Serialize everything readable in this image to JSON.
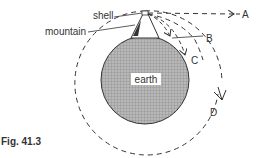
{
  "figure": {
    "caption": "Fig. 41.3",
    "labels": {
      "shell": "shell",
      "mountain": "mountain",
      "earth": "earth",
      "A": "A",
      "B": "B",
      "C": "C",
      "D": "D"
    },
    "colors": {
      "ink": "#333333",
      "earth_fill": "#a9a9a9",
      "background": "#ffffff"
    }
  }
}
